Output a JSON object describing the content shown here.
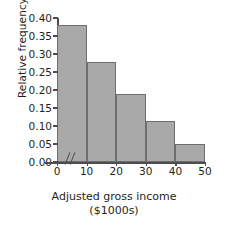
{
  "chart_data": {
    "type": "bar",
    "title": "",
    "subtitle": "",
    "xlabel": "Adjusted gross income",
    "xlabel_units": "($1000s)",
    "ylabel": "Relative frequency",
    "categories": [
      "0-10",
      "10-20",
      "20-30",
      "30-40",
      "40-50"
    ],
    "bin_edges": [
      0,
      10,
      20,
      30,
      40,
      50
    ],
    "values": [
      0.38,
      0.278,
      0.19,
      0.113,
      0.05
    ],
    "xtick_labels": [
      "0",
      "10",
      "20",
      "30",
      "40",
      "50"
    ],
    "ytick_labels": [
      "0.00",
      "0.05",
      "0.10",
      "0.15",
      "0.20",
      "0.25",
      "0.30",
      "0.35",
      "0.40"
    ],
    "ytick_values": [
      0.0,
      0.05,
      0.1,
      0.15,
      0.2,
      0.25,
      0.3,
      0.35,
      0.4
    ],
    "ylim": [
      0,
      0.4
    ],
    "xlim": [
      0,
      50
    ],
    "grid": false,
    "legend": false,
    "axis_break": true,
    "axis_break_glyph": "//",
    "bar_fill_color": "#a9a9a9",
    "bar_edge_color": "#6e6e6e",
    "axis_color": "#4d4d4d",
    "text_color": "#231f20",
    "background_color": "#ffffff"
  }
}
